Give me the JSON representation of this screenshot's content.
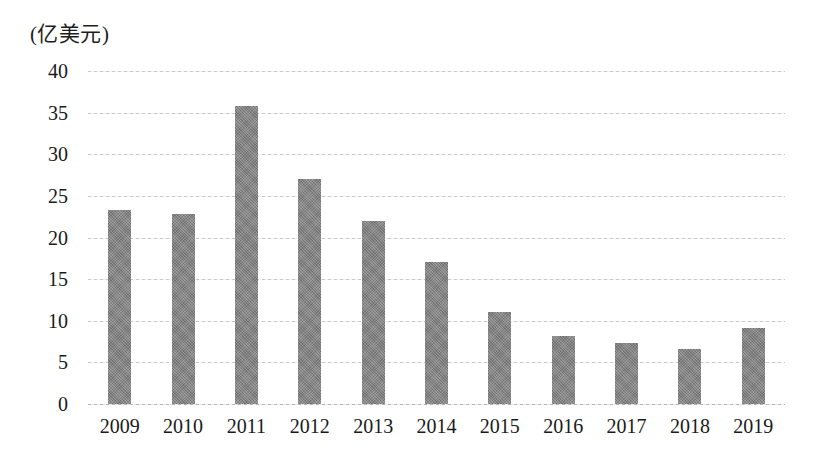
{
  "chart_data": {
    "type": "bar",
    "title": "",
    "subtitle": "",
    "unit_label": "(亿美元)",
    "xlabel": "",
    "ylabel": "",
    "categories": [
      "2009",
      "2010",
      "2011",
      "2012",
      "2013",
      "2014",
      "2015",
      "2016",
      "2017",
      "2018",
      "2019"
    ],
    "values": [
      23.3,
      22.8,
      35.8,
      27.0,
      22.0,
      17.0,
      11.0,
      8.2,
      7.3,
      6.6,
      9.1
    ],
    "ylim": [
      0,
      40
    ],
    "ytick_values": [
      40,
      35,
      30,
      25,
      20,
      15,
      10,
      5,
      0
    ],
    "ytick_labels": [
      "40",
      "35",
      "30",
      "25",
      "20",
      "15",
      "10",
      "5",
      "0"
    ],
    "grid": true,
    "grid_axis": "y",
    "legend": false,
    "legend_position": "none",
    "bar_color": "#7e7e7e",
    "grid_color": "#c9c9c9",
    "text_color": "#1a1a1a",
    "background_color": "#ffffff"
  }
}
